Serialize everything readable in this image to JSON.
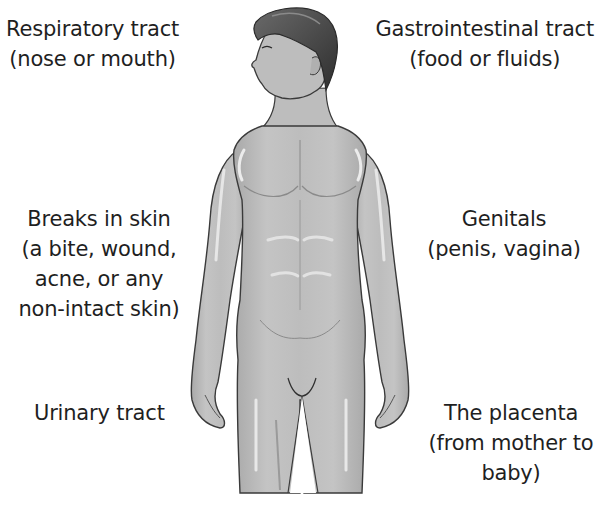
{
  "diagram": {
    "type": "routes-of-entry-human-body",
    "colors": {
      "background": "#ffffff",
      "text": "#1f1f1f",
      "skin": "#b9b9b9",
      "skin_highlight": "#e2e2e2",
      "skin_shadow": "#9a9a9a",
      "hair": "#4a4a4a",
      "outline": "#3a3a3a"
    },
    "labels": {
      "respiratory": {
        "title": "Respiratory tract",
        "detail": "(nose or mouth)"
      },
      "gastrointestinal": {
        "title": "Gastrointestinal tract",
        "detail": "(food or fluids)"
      },
      "skin": {
        "title": "Breaks in skin",
        "detail_line1": "(a bite, wound,",
        "detail_line2": "acne, or any",
        "detail_line3": "non-intact skin)"
      },
      "genitals": {
        "title": "Genitals",
        "detail": "(penis, vagina)"
      },
      "urinary": {
        "title": "Urinary tract"
      },
      "placenta": {
        "title": "The placenta",
        "detail_line1": "(from mother to",
        "detail_line2": "baby)"
      }
    }
  }
}
